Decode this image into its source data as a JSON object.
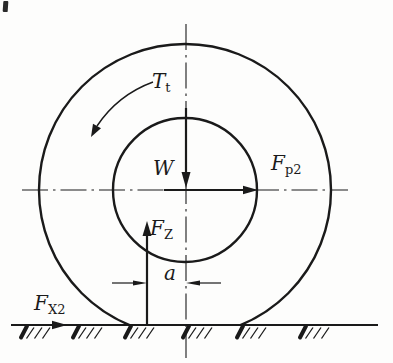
{
  "figure": {
    "kind": "wheel-force-diagram",
    "ink_color": "#1a1a1a",
    "background_color": "#fdfdfc",
    "labels": {
      "torque": {
        "main": "T",
        "sub": "t"
      },
      "weight": {
        "main": "W",
        "sub": ""
      },
      "push_force": {
        "main": "F",
        "sub": "p2"
      },
      "normal_reaction": {
        "main": "F",
        "sub": "Z"
      },
      "offset_distance": {
        "main": "a",
        "sub": ""
      },
      "traction_force": {
        "main": "F",
        "sub": "X2"
      }
    }
  }
}
